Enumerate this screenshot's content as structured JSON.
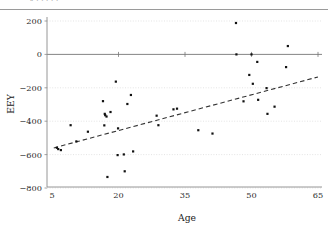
{
  "figure": {
    "top_partial_text": "„       ,                              ,       ,      ,   ,",
    "background_color": "#ffffff",
    "marker_color": "#111111",
    "trendline_color": "#333333",
    "grid_color": "#d8d8d8",
    "axis_color": "#8a8a8a"
  },
  "chart_data": {
    "type": "scatter",
    "title": "",
    "xlabel": "Age",
    "ylabel": "EEY",
    "xlim": [
      5,
      65
    ],
    "ylim": [
      -800,
      240
    ],
    "xticks": [
      5,
      20,
      35,
      50,
      65
    ],
    "xtick_labels": [
      "5",
      "20",
      "35",
      "50",
      "65"
    ],
    "yticks": [
      200,
      0,
      -200,
      -400,
      -600,
      -800
    ],
    "ytick_labels": [
      "200",
      "0",
      "-200",
      "-400",
      "-600",
      "-800"
    ],
    "grid": true,
    "grid_axis": "y",
    "legend": null,
    "zero_line": true,
    "series": [
      {
        "name": "observations",
        "marker": "square",
        "color": "#111111",
        "points": [
          [
            6.1,
            -559
          ],
          [
            6.4,
            -567
          ],
          [
            7.0,
            -573
          ],
          [
            9.2,
            -424
          ],
          [
            10.5,
            -521
          ],
          [
            13.1,
            -463
          ],
          [
            16.5,
            -280
          ],
          [
            16.8,
            -425
          ],
          [
            16.9,
            -356
          ],
          [
            17.0,
            -364
          ],
          [
            17.3,
            -372
          ],
          [
            17.5,
            -734
          ],
          [
            18.2,
            -345
          ],
          [
            19.4,
            -163
          ],
          [
            19.8,
            -603
          ],
          [
            19.9,
            -443
          ],
          [
            21.2,
            -599
          ],
          [
            21.4,
            -700
          ],
          [
            22.0,
            -297
          ],
          [
            22.8,
            -243
          ],
          [
            23.3,
            -581
          ],
          [
            28.6,
            -367
          ],
          [
            29.0,
            -424
          ],
          [
            32.4,
            -329
          ],
          [
            33.2,
            -325
          ],
          [
            38.0,
            -454
          ],
          [
            41.2,
            -474
          ],
          [
            46.5,
            188
          ],
          [
            46.6,
            0
          ],
          [
            48.2,
            -281
          ],
          [
            49.5,
            -123
          ],
          [
            50.0,
            0
          ],
          [
            50.3,
            -176
          ],
          [
            51.3,
            -45
          ],
          [
            51.5,
            -272
          ],
          [
            53.4,
            -202
          ],
          [
            53.6,
            -356
          ],
          [
            55.2,
            -313
          ],
          [
            57.8,
            -76
          ],
          [
            58.2,
            50
          ]
        ]
      }
    ],
    "trendline": {
      "name": "fitted line",
      "style": "dashed",
      "color": "#333333",
      "x_start": 5.4,
      "y_start": -560,
      "x_end": 65.0,
      "y_end": -135
    }
  }
}
